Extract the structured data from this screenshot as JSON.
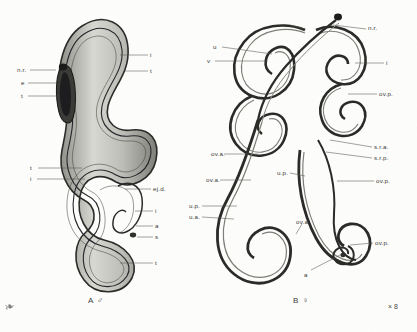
{
  "plate": {
    "background_color": "#fdfdfc",
    "ink_color": "#2b2b29",
    "shade_color": "#9a9a95",
    "scale_note": "× 8",
    "corner_artifact": "❧"
  },
  "figures": [
    {
      "id": "A",
      "caption": "A  ♂",
      "sex": "male",
      "caption_x": 88,
      "caption_y": 296,
      "labels": [
        {
          "text": "n.r.",
          "x": 17,
          "y": 67,
          "lx1": 30,
          "ly1": 70,
          "lx2": 56,
          "ly2": 70,
          "side": "left"
        },
        {
          "text": "e",
          "x": 21,
          "y": 80,
          "lx1": 28,
          "ly1": 83,
          "lx2": 57,
          "ly2": 83,
          "side": "left"
        },
        {
          "text": "t",
          "x": 21,
          "y": 93,
          "lx1": 28,
          "ly1": 96,
          "lx2": 58,
          "ly2": 96,
          "side": "left"
        },
        {
          "text": "i",
          "x": 150,
          "y": 52,
          "lx1": 148,
          "ly1": 55,
          "lx2": 120,
          "ly2": 55,
          "side": "right"
        },
        {
          "text": "t",
          "x": 150,
          "y": 68,
          "lx1": 148,
          "ly1": 71,
          "lx2": 125,
          "ly2": 71,
          "side": "right"
        },
        {
          "text": "t",
          "x": 30,
          "y": 165,
          "lx1": 38,
          "ly1": 168,
          "lx2": 82,
          "ly2": 168,
          "side": "left"
        },
        {
          "text": "i",
          "x": 30,
          "y": 176,
          "lx1": 37,
          "ly1": 179,
          "lx2": 85,
          "ly2": 179,
          "side": "left"
        },
        {
          "text": "ej.d.",
          "x": 153,
          "y": 186,
          "lx1": 151,
          "ly1": 189,
          "lx2": 125,
          "ly2": 189,
          "side": "right"
        },
        {
          "text": "i",
          "x": 155,
          "y": 208,
          "lx1": 153,
          "ly1": 211,
          "lx2": 135,
          "ly2": 211,
          "side": "right"
        },
        {
          "text": "a",
          "x": 155,
          "y": 223,
          "lx1": 153,
          "ly1": 226,
          "lx2": 136,
          "ly2": 226,
          "side": "right"
        },
        {
          "text": "s",
          "x": 155,
          "y": 234,
          "lx1": 153,
          "ly1": 237,
          "lx2": 137,
          "ly2": 237,
          "side": "right"
        },
        {
          "text": "t",
          "x": 155,
          "y": 260,
          "lx1": 153,
          "ly1": 263,
          "lx2": 120,
          "ly2": 263,
          "side": "right"
        }
      ]
    },
    {
      "id": "B",
      "caption": "B  ♀",
      "sex": "female",
      "caption_x": 293,
      "caption_y": 296,
      "labels": [
        {
          "text": "e",
          "x": 283,
          "y": 22,
          "lx1": 290,
          "ly1": 25,
          "lx2": 305,
          "ly2": 29,
          "side": "right"
        },
        {
          "text": "n.r.",
          "x": 368,
          "y": 25,
          "lx1": 366,
          "ly1": 29,
          "lx2": 333,
          "ly2": 25,
          "side": "right"
        },
        {
          "text": "u",
          "x": 213,
          "y": 44,
          "lx1": 222,
          "ly1": 47,
          "lx2": 272,
          "ly2": 54,
          "side": "left"
        },
        {
          "text": "v",
          "x": 207,
          "y": 58,
          "lx1": 215,
          "ly1": 61,
          "lx2": 268,
          "ly2": 61,
          "side": "left"
        },
        {
          "text": "i",
          "x": 386,
          "y": 60,
          "lx1": 384,
          "ly1": 63,
          "lx2": 355,
          "ly2": 63,
          "side": "right"
        },
        {
          "text": "ov.p.",
          "x": 379,
          "y": 91,
          "lx1": 377,
          "ly1": 94,
          "lx2": 348,
          "ly2": 94,
          "side": "right"
        },
        {
          "text": "ov.a.",
          "x": 211,
          "y": 151,
          "lx1": 224,
          "ly1": 154,
          "lx2": 258,
          "ly2": 154,
          "side": "left"
        },
        {
          "text": "ov.a.",
          "x": 206,
          "y": 177,
          "lx1": 220,
          "ly1": 180,
          "lx2": 251,
          "ly2": 180,
          "side": "left"
        },
        {
          "text": "s.r.a.",
          "x": 374,
          "y": 144,
          "lx1": 372,
          "ly1": 147,
          "lx2": 330,
          "ly2": 140,
          "side": "right"
        },
        {
          "text": "s.r.p.",
          "x": 374,
          "y": 155,
          "lx1": 372,
          "ly1": 158,
          "lx2": 326,
          "ly2": 152,
          "side": "right"
        },
        {
          "text": "ov.p.",
          "x": 376,
          "y": 178,
          "lx1": 374,
          "ly1": 181,
          "lx2": 337,
          "ly2": 181,
          "side": "right"
        },
        {
          "text": "u.p.",
          "x": 277,
          "y": 170,
          "lx1": 290,
          "ly1": 173,
          "lx2": 305,
          "ly2": 176,
          "side": "right"
        },
        {
          "text": "u.p.",
          "x": 189,
          "y": 203,
          "lx1": 202,
          "ly1": 206,
          "lx2": 237,
          "ly2": 206,
          "side": "left"
        },
        {
          "text": "u.a.",
          "x": 189,
          "y": 214,
          "lx1": 202,
          "ly1": 217,
          "lx2": 234,
          "ly2": 219,
          "side": "left"
        },
        {
          "text": "ov.a.",
          "x": 296,
          "y": 219,
          "lx1": 302,
          "ly1": 224,
          "lx2": 296,
          "ly2": 234,
          "side": "right"
        },
        {
          "text": "ov.p.",
          "x": 375,
          "y": 240,
          "lx1": 373,
          "ly1": 243,
          "lx2": 350,
          "ly2": 245,
          "side": "right"
        },
        {
          "text": "a",
          "x": 304,
          "y": 272,
          "lx1": 311,
          "ly1": 270,
          "lx2": 342,
          "ly2": 254,
          "side": "right"
        }
      ]
    }
  ]
}
